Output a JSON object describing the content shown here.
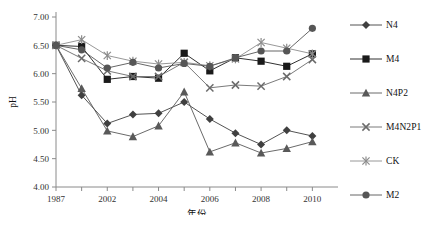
{
  "chart_data": {
    "type": "line",
    "title": "",
    "xlabel": "年份",
    "ylabel": "pH",
    "xlim": [
      0,
      11
    ],
    "ylim": [
      4.0,
      7.0
    ],
    "ytick_labels": [
      "7.00",
      "6.50",
      "6.00",
      "5.50",
      "5.00",
      "4.50",
      "4.00"
    ],
    "ytick_values": [
      7.0,
      6.5,
      6.0,
      5.5,
      5.0,
      4.5,
      4.0
    ],
    "xtick_labels": [
      "1987",
      "2002",
      "2004",
      "2006",
      "2008",
      "2010"
    ],
    "xtick_values": [
      0,
      2,
      4,
      6,
      8,
      10
    ],
    "x": [
      0,
      1,
      2,
      3,
      4,
      5,
      6,
      7,
      8,
      9,
      10
    ],
    "x_year_labels": [
      "1987",
      "2001",
      "2002",
      "2003",
      "2004",
      "2005",
      "2006",
      "2007",
      "2008",
      "2009",
      "2010"
    ],
    "grid": false,
    "legend_position": "right",
    "series": [
      {
        "name": "N4",
        "marker": "diamond",
        "color": "#404040",
        "values": [
          6.5,
          5.62,
          5.12,
          5.28,
          5.3,
          5.5,
          5.2,
          4.95,
          4.75,
          5.0,
          4.9
        ]
      },
      {
        "name": "M4",
        "marker": "square",
        "color": "#1a1a1a",
        "values": [
          6.5,
          6.48,
          5.9,
          5.95,
          5.92,
          6.36,
          6.05,
          6.28,
          6.22,
          6.13,
          6.35
        ]
      },
      {
        "name": "N4P2",
        "marker": "triangle",
        "color": "#595959",
        "values": [
          6.5,
          5.74,
          4.99,
          4.89,
          5.08,
          5.68,
          4.62,
          4.78,
          4.6,
          4.68,
          4.8
        ]
      },
      {
        "name": "M4N2P1",
        "marker": "cross",
        "color": "#6b6b6b",
        "values": [
          6.5,
          6.27,
          6.05,
          5.95,
          5.95,
          6.2,
          5.75,
          5.8,
          5.78,
          5.95,
          6.25
        ]
      },
      {
        "name": "CK",
        "marker": "asterisk",
        "color": "#8c8c8c",
        "values": [
          6.5,
          6.6,
          6.32,
          6.22,
          6.17,
          6.2,
          6.14,
          6.26,
          6.55,
          6.45,
          6.35
        ]
      },
      {
        "name": "M2",
        "marker": "circle",
        "color": "#565656",
        "values": [
          6.5,
          6.42,
          6.1,
          6.2,
          6.1,
          6.18,
          6.13,
          6.28,
          6.4,
          6.4,
          6.8
        ]
      }
    ]
  },
  "legend": {
    "items": [
      {
        "label": "N4"
      },
      {
        "label": "M4"
      },
      {
        "label": "N4P2"
      },
      {
        "label": "M4N2P1"
      },
      {
        "label": "CK"
      },
      {
        "label": "M2"
      }
    ]
  },
  "axis": {
    "y_title": "pH",
    "x_title": "年份"
  }
}
